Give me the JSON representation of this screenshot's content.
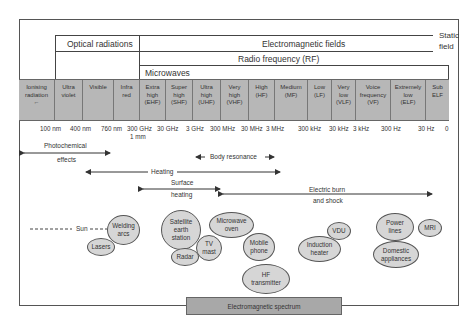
{
  "headers": {
    "optical": "Optical radiations",
    "em_fields": "Electromagnetic fields",
    "rf": "Radio frequency (RF)",
    "microwaves": "Microwaves",
    "static_field_line1": "Static",
    "static_field_line2": "field"
  },
  "bands": [
    {
      "l1": "Ionising",
      "l2": "radiation",
      "l3": "←",
      "w": 36
    },
    {
      "l1": "Ultra",
      "l2": "violet",
      "l3": "",
      "w": 28
    },
    {
      "l1": "Visible",
      "l2": "",
      "l3": "",
      "w": 31
    },
    {
      "l1": "Infra",
      "l2": "red",
      "l3": "",
      "w": 26
    },
    {
      "l1": "Extra",
      "l2": "high",
      "l3": "(EHF)",
      "w": 26
    },
    {
      "l1": "Super",
      "l2": "high",
      "l3": "(SHF)",
      "w": 27
    },
    {
      "l1": "Ultra",
      "l2": "high",
      "l3": "(UHF)",
      "w": 28
    },
    {
      "l1": "Very",
      "l2": "high",
      "l3": "(VHF)",
      "w": 28
    },
    {
      "l1": "High",
      "l2": "(HF)",
      "l3": "",
      "w": 26
    },
    {
      "l1": "Medium",
      "l2": "(MF)",
      "l3": "",
      "w": 33
    },
    {
      "l1": "Low",
      "l2": "(LF)",
      "l3": "",
      "w": 24
    },
    {
      "l1": "Very",
      "l2": "low",
      "l3": "(VLF)",
      "w": 24
    },
    {
      "l1": "Voice",
      "l2": "frequency",
      "l3": "(VF)",
      "w": 35
    },
    {
      "l1": "Extremely",
      "l2": "low",
      "l3": "(ELF)",
      "w": 35
    },
    {
      "l1": "Sub",
      "l2": "ELF",
      "l3": "",
      "w": 23
    }
  ],
  "ticks": [
    {
      "label": "100 nm",
      "x": 40
    },
    {
      "label": "400 nm",
      "x": 70
    },
    {
      "label": "760 nm",
      "x": 101
    },
    {
      "label": "300 GHz",
      "x": 128
    },
    {
      "label": "1 mm",
      "x": 130
    },
    {
      "label": "30 GHz",
      "x": 157
    },
    {
      "label": "3 GHz",
      "x": 186
    },
    {
      "label": "300 MHz",
      "x": 210
    },
    {
      "label": "30 MHz",
      "x": 241
    },
    {
      "label": "3 MHz",
      "x": 266
    },
    {
      "label": "300 kHz",
      "x": 298
    },
    {
      "label": "30 kHz",
      "x": 329
    },
    {
      "label": "3 kHz",
      "x": 353
    },
    {
      "label": "300 Hz",
      "x": 381
    },
    {
      "label": "30 Hz",
      "x": 418
    },
    {
      "label": "0",
      "x": 445
    }
  ],
  "effects": {
    "photochemical_1": "Photochemical",
    "photochemical_2": "effects",
    "body_resonance": "Body resonance",
    "heating": "Heating",
    "surface_heating_1": "Surface",
    "surface_heating_2": "heating",
    "electric_burn_1": "Electric burn",
    "electric_burn_2": "and shock"
  },
  "sources": {
    "sun": "Sun",
    "welding_1": "Welding",
    "welding_2": "arcs",
    "lasers": "Lasers",
    "satellite_1": "Satellite",
    "satellite_2": "earth",
    "satellite_3": "station",
    "radar": "Radar",
    "tv_1": "TV",
    "tv_2": "mast",
    "microwave_1": "Microwave",
    "microwave_2": "oven",
    "mobile_1": "Mobile",
    "mobile_2": "phone",
    "hf_1": "HF",
    "hf_2": "transmitter",
    "vdu": "VDU",
    "induction_1": "Induction",
    "induction_2": "heater",
    "power_1": "Power",
    "power_2": "lines",
    "mri": "MRI",
    "domestic_1": "Domestic",
    "domestic_2": "appliances"
  },
  "footer": {
    "spectrum_label": "Electromagnetic spectrum"
  },
  "colors": {
    "band_fill": "#b7b7b7",
    "bubble_fill": "#d6d6d6",
    "spectrum_fill": "#a8a8a8"
  }
}
